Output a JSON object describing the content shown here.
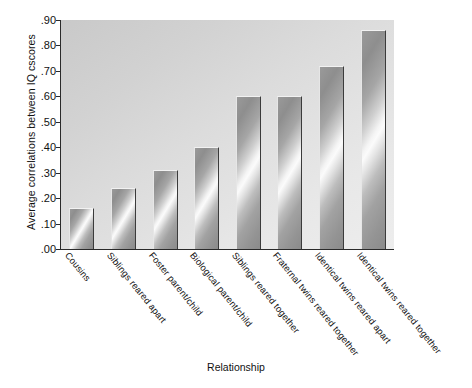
{
  "chart_data": {
    "type": "bar",
    "title": "",
    "xlabel": "Relationship",
    "ylabel": "Average correlations between IQ cscores",
    "categories": [
      "Cousins",
      "Siblings reared apart",
      "Foster parent/child",
      "Biological parent/child",
      "Siblings reared together",
      "Fraternal twins reared together",
      "Identical twins reared apart",
      "Identical twins reared together"
    ],
    "values": [
      0.16,
      0.24,
      0.31,
      0.4,
      0.6,
      0.6,
      0.72,
      0.86
    ],
    "ylim": [
      0.0,
      0.9
    ],
    "yticks": [
      0.0,
      0.1,
      0.2,
      0.3,
      0.4,
      0.5,
      0.6,
      0.7,
      0.8,
      0.9
    ],
    "ytick_labels": [
      ".00",
      ".10",
      ".20",
      ".30",
      ".40",
      ".50",
      ".60",
      ".70",
      ".80",
      ".90"
    ],
    "grid": false,
    "legend": "none",
    "series_name": "Average IQ correlation",
    "bar_color": "#b4b4b4",
    "plot_background": "#dcdcdc",
    "axis_color": "#2a2a2a"
  }
}
